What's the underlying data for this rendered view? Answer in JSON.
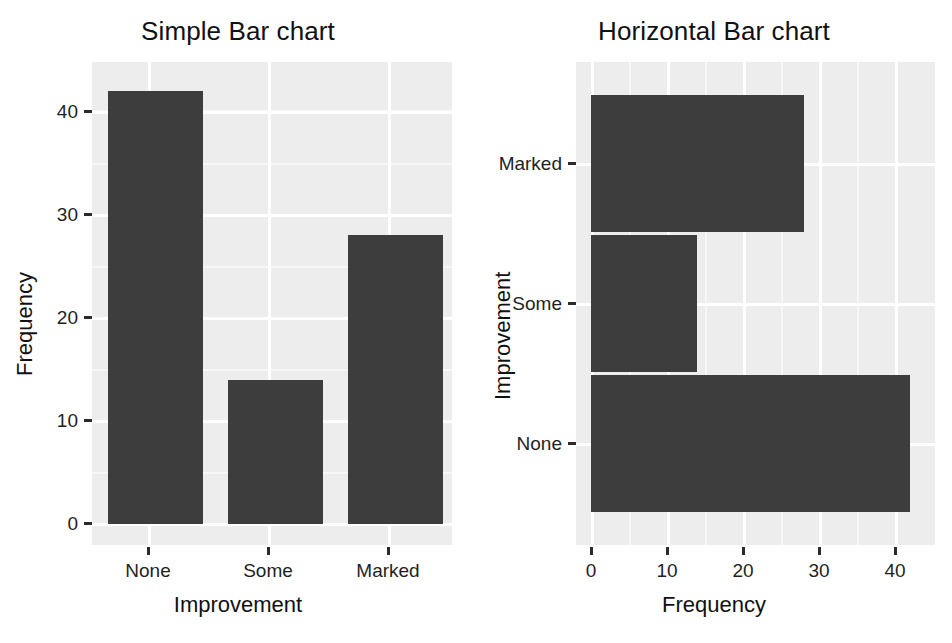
{
  "figure": {
    "background_color": "#ffffff",
    "panel_color": "#ededed",
    "grid_color": "#ffffff",
    "bar_color": "#3d3d3d"
  },
  "left_chart": {
    "title": "Simple Bar chart",
    "xlabel": "Improvement",
    "ylabel": "Frequency",
    "xticks": [
      "None",
      "Some",
      "Marked"
    ],
    "yticks": [
      "0",
      "10",
      "20",
      "30",
      "40"
    ]
  },
  "right_chart": {
    "title": "Horizontal Bar chart",
    "xlabel": "Frequency",
    "ylabel": "Improvement",
    "xticks": [
      "0",
      "10",
      "20",
      "30",
      "40"
    ],
    "yticks": [
      "Marked",
      "Some",
      "None"
    ]
  },
  "chart_data": [
    {
      "type": "bar",
      "orientation": "vertical",
      "title": "Simple Bar chart",
      "xlabel": "Improvement",
      "ylabel": "Frequency",
      "categories": [
        "None",
        "Some",
        "Marked"
      ],
      "values": [
        42,
        14,
        28
      ],
      "ylim": [
        0,
        44.5
      ],
      "yticks": [
        0,
        10,
        20,
        30,
        40
      ],
      "grid": true,
      "legend": "none",
      "bar_color": "#3d3d3d"
    },
    {
      "type": "bar",
      "orientation": "horizontal",
      "title": "Horizontal Bar chart",
      "xlabel": "Frequency",
      "ylabel": "Improvement",
      "categories": [
        "None",
        "Some",
        "Marked"
      ],
      "values": [
        42,
        14,
        28
      ],
      "category_order_top_to_bottom": [
        "Marked",
        "Some",
        "None"
      ],
      "xlim": [
        0,
        45
      ],
      "xticks": [
        0,
        10,
        20,
        30,
        40
      ],
      "grid": true,
      "legend": "none",
      "bar_color": "#3d3d3d"
    }
  ]
}
